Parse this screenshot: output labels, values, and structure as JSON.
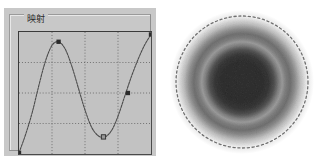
{
  "panel": {
    "title": "映射",
    "background_color": "#c8c8c8",
    "border_color": "#8d8d8d"
  },
  "plot": {
    "background_color": "#c2c2c2",
    "border_color": "#3a3a3a",
    "grid_color": "#5a5a5a",
    "curve_color": "#4a4a4a",
    "marker_color": "#2b2b2b",
    "marker_open_color": "#9a9a9a"
  },
  "pattern": {
    "name": "diffraction-pattern",
    "background_color": "#ffffff",
    "outline_color": "#6f6f6f",
    "core_color": "#6e6e6e",
    "ring_color": "#9d9d9d"
  },
  "chart_data": {
    "type": "line",
    "title": "映射",
    "xlabel": "",
    "ylabel": "",
    "xlim": [
      0,
      10
    ],
    "ylim": [
      0,
      10
    ],
    "grid": true,
    "grid_x": [
      2.5,
      5.0,
      7.5
    ],
    "grid_y": [
      2.5,
      5.0,
      7.5
    ],
    "legend": "none",
    "series": [
      {
        "name": "curve",
        "x": [
          0.0,
          0.5,
          1.0,
          1.5,
          2.0,
          2.5,
          3.0,
          3.5,
          4.0,
          4.5,
          5.0,
          5.5,
          6.0,
          6.5,
          7.0,
          7.5,
          8.0,
          8.5,
          9.0,
          9.5,
          10.0
        ],
        "y": [
          0.1,
          1.6,
          3.4,
          5.6,
          7.6,
          8.9,
          9.2,
          8.6,
          7.2,
          5.4,
          3.6,
          2.2,
          1.5,
          1.4,
          1.9,
          3.1,
          4.7,
          6.3,
          7.7,
          8.9,
          9.8
        ]
      }
    ],
    "markers": [
      {
        "name": "start-point",
        "x": 0.0,
        "y": 0.1,
        "style": "filled"
      },
      {
        "name": "peak-point",
        "x": 3.0,
        "y": 9.2,
        "style": "filled"
      },
      {
        "name": "trough-point",
        "x": 6.4,
        "y": 1.4,
        "style": "open"
      },
      {
        "name": "mid-point",
        "x": 8.25,
        "y": 5.0,
        "style": "filled"
      },
      {
        "name": "end-point",
        "x": 10.0,
        "y": 9.8,
        "style": "filled"
      }
    ]
  }
}
